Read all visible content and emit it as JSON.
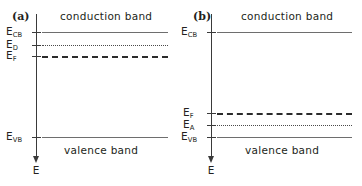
{
  "figure": {
    "width": 362,
    "height": 186,
    "background": "#ffffff",
    "line_color_solid": "#6e6e6e",
    "line_color_dotted": "#4a4a4a",
    "line_color_dashed": "#2b2b2b",
    "axis_color": "#3a3a3a",
    "text_color": "#231f20"
  },
  "panels": [
    {
      "letter": "(a)",
      "conduction_band_label": "conduction band",
      "valence_band_label": "valence band",
      "axis_label": "E",
      "levels": [
        {
          "label": "E",
          "subscript": "CB",
          "style": "solid",
          "y": 32
        },
        {
          "label": "E",
          "subscript": "D",
          "style": "dotted",
          "y": 45
        },
        {
          "label": "E",
          "subscript": "F",
          "style": "dashed",
          "y": 56
        },
        {
          "label": "E",
          "subscript": "VB",
          "style": "solid",
          "y": 137
        }
      ]
    },
    {
      "letter": "(b)",
      "conduction_band_label": "conduction band",
      "valence_band_label": "valence band",
      "axis_label": "E",
      "levels": [
        {
          "label": "E",
          "subscript": "CB",
          "style": "solid",
          "y": 32
        },
        {
          "label": "E",
          "subscript": "F",
          "style": "dashed",
          "y": 113
        },
        {
          "label": "E",
          "subscript": "A",
          "style": "dotted",
          "y": 125
        },
        {
          "label": "E",
          "subscript": "VB",
          "style": "solid",
          "y": 137
        }
      ]
    }
  ]
}
